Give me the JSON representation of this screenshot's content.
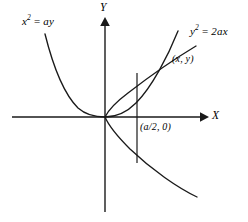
{
  "figure": {
    "type": "analytic-geometry-diagram",
    "background_color": "#ffffff",
    "stroke_color": "#1a1a1a",
    "width": 248,
    "height": 222,
    "axes": {
      "x_label": "X",
      "y_label": "Y",
      "origin": {
        "x": 105,
        "y": 117
      },
      "x_start": {
        "x": 12,
        "y": 117
      },
      "x_end": {
        "x": 205,
        "y": 117
      },
      "y_top": {
        "x": 105,
        "y": 18
      },
      "y_bottom": {
        "x": 105,
        "y": 212
      },
      "arrowheads": [
        "x-positive",
        "y-positive"
      ]
    },
    "curves": [
      {
        "name": "parabola-x2-ay",
        "equation_label": "x² = ay",
        "label_text_main": "x",
        "label_exponent": "2",
        "label_equals": "=",
        "label_rhs": "ay",
        "description": "upward opening parabola, vertex at origin",
        "label_position": {
          "x": 22,
          "y": 22
        }
      },
      {
        "name": "parabola-y2-2ax",
        "equation_label": "y² = 2ax",
        "label_text_main": "y",
        "label_exponent": "2",
        "label_equals": "=",
        "label_rhs": "2ax",
        "description": "rightward opening parabola, vertex at origin",
        "label_position": {
          "x": 190,
          "y": 32
        }
      }
    ],
    "annotations": [
      {
        "name": "intersection-point-label",
        "text": "(x, y)",
        "position": {
          "x": 172,
          "y": 60
        },
        "refers_to": "intersection of the two parabolas"
      },
      {
        "name": "focus-point-label",
        "text": "(a/2, 0)",
        "position": {
          "x": 140,
          "y": 128
        },
        "refers_to": "point on the X axis at x = a/2"
      }
    ],
    "chord": {
      "name": "vertical-chord",
      "x": 137,
      "y_top": 73,
      "y_bottom": 163,
      "description": "vertical segment through (a/2, 0)"
    }
  }
}
